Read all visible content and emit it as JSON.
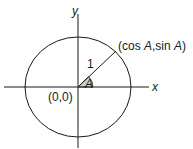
{
  "diagram": {
    "axes": {
      "x_label": "x",
      "y_label": "y"
    },
    "origin_label": "(0,0)",
    "radius_label": "1",
    "angle_label": "A",
    "point_label": {
      "prefix": "(cos ",
      "a1": "A",
      "mid": ",sin ",
      "a2": "A",
      "suffix": ")"
    },
    "colors": {
      "stroke": "#1a1a1a",
      "angle_fill": "#c8c8c8"
    }
  }
}
